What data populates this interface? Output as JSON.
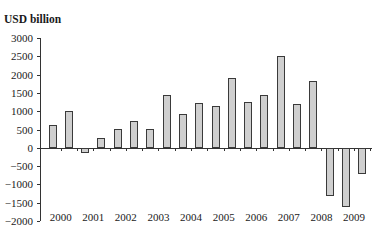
{
  "chart_data": {
    "type": "bar",
    "title": "",
    "ylabel": "USD billion",
    "xlabel": "",
    "ylim": [
      -2000,
      3000
    ],
    "yticks": [
      3000,
      2500,
      2000,
      1500,
      1000,
      500,
      0,
      -500,
      -1000,
      -1500,
      -2000
    ],
    "year_labels": [
      "2000",
      "2001",
      "2002",
      "2003",
      "2004",
      "2005",
      "2006",
      "2007",
      "2008",
      "2009"
    ],
    "categories": [
      "2000 H1",
      "2000 H2",
      "2001 H1",
      "2001 H2",
      "2002 H1",
      "2002 H2",
      "2003 H1",
      "2003 H2",
      "2004 H1",
      "2004 H2",
      "2005 H1",
      "2005 H2",
      "2006 H1",
      "2006 H2",
      "2007 H1",
      "2007 H2",
      "2008 H1",
      "2008 H2",
      "2009 H1",
      "2009 H2"
    ],
    "values": [
      620,
      1010,
      -130,
      270,
      510,
      720,
      520,
      1430,
      925,
      1235,
      1135,
      1900,
      1245,
      1445,
      2500,
      1190,
      1835,
      -1315,
      -1615,
      -710
    ],
    "grid": false,
    "legend": null,
    "bar_color": "#cfcfcf",
    "bar_edge_color": "#3a3a3a"
  }
}
